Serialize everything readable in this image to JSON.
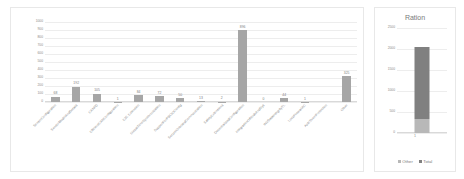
{
  "left_chart": {
    "yticks": [
      "1000",
      "900",
      "800",
      "700",
      "600",
      "500",
      "400",
      "300",
      "200",
      "100",
      "0"
    ]
  },
  "right_chart": {
    "title": "Ration",
    "yticks": [
      "2500",
      "2000",
      "1500",
      "1000",
      "500",
      "0"
    ],
    "xlabel": "1",
    "legend": [
      {
        "label": "Other",
        "color": "#b8b8b8"
      },
      {
        "label": "Total",
        "color": "#808080"
      }
    ]
  },
  "chart_data": [
    {
      "type": "bar",
      "title": "",
      "xlabel": "",
      "ylabel": "",
      "ylim": [
        0,
        1000
      ],
      "grid": true,
      "legend_position": "none",
      "bar_color": "#a6a6a6",
      "categories": [
        "SensorConfiguration",
        "SensorModelAndDetails",
        "CANFD",
        "EfficientCANConfiguration",
        "E2E Extension",
        "GlobalTimeSynchronization",
        "SupportForPBCIOConfig",
        "SecureOnboardCommunication",
        "SafetyExtensions",
        "DecentralizedConfiguration",
        "IntegrationOfNodeAndSys",
        "INVDataIntegrityTL",
        "LockFirewallAC",
        "AutoThemProtection",
        "Other"
      ],
      "values": [
        68,
        192,
        105,
        1,
        84,
        72,
        50,
        13,
        2,
        896,
        0,
        44,
        1,
        0,
        325
      ],
      "data_labels": [
        "68",
        "192",
        "105",
        "1",
        "84",
        "72",
        "50",
        "13",
        "2",
        "896",
        "0",
        "44",
        "1",
        "",
        "325"
      ]
    },
    {
      "type": "bar",
      "title": "Ration",
      "xlabel": "1",
      "ylabel": "",
      "ylim": [
        0,
        2500
      ],
      "grid": true,
      "stacked": true,
      "legend_position": "bottom",
      "categories": [
        "1"
      ],
      "series": [
        {
          "name": "Other",
          "values": [
            325
          ],
          "color": "#b8b8b8"
        },
        {
          "name": "Total",
          "values": [
            1730
          ],
          "color": "#808080"
        }
      ]
    }
  ]
}
